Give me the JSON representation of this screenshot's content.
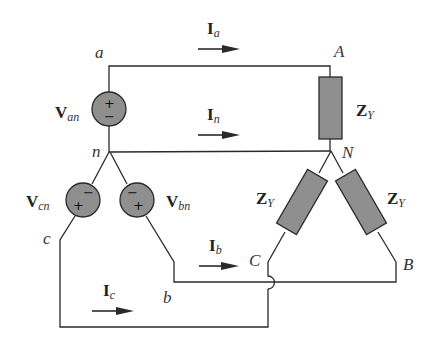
{
  "diagram": {
    "type": "three-phase Y-Y circuit",
    "nodes": {
      "a": "a",
      "b": "b",
      "c": "c",
      "n": "n",
      "A": "A",
      "B": "B",
      "C": "C",
      "N": "N"
    },
    "sources": [
      {
        "id": "Van",
        "main": "V",
        "sub": "an",
        "top_sign": "±",
        "bottom_sign": "",
        "polarity": "+ top, − bottom"
      },
      {
        "id": "Vcn",
        "main": "V",
        "sub": "cn",
        "top_sign": "−",
        "bottom_sign": "+"
      },
      {
        "id": "Vbn",
        "main": "V",
        "sub": "bn",
        "top_sign": "−",
        "bottom_sign": "+"
      }
    ],
    "loads": [
      {
        "id": "ZY_AN",
        "main": "Z",
        "sub": "Y"
      },
      {
        "id": "ZY_CN",
        "main": "Z",
        "sub": "Y"
      },
      {
        "id": "ZY_BN",
        "main": "Z",
        "sub": "Y"
      }
    ],
    "currents": [
      {
        "id": "Ia",
        "main": "I",
        "sub": "a"
      },
      {
        "id": "In",
        "main": "I",
        "sub": "n"
      },
      {
        "id": "Ib",
        "main": "I",
        "sub": "b"
      },
      {
        "id": "Ic",
        "main": "I",
        "sub": "c"
      }
    ],
    "colors": {
      "component_fill": "#8f8f8f",
      "wire": "#2a2a2a",
      "background": "#ffffff"
    }
  }
}
